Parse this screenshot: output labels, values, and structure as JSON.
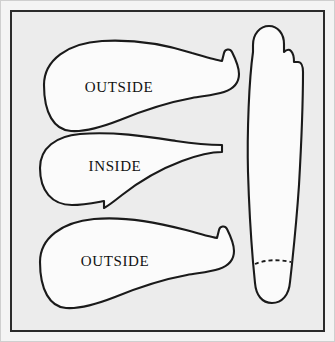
{
  "figure": {
    "background_color": "#ececec",
    "frame_color": "#2b2b2b",
    "piece_fill": "#fbfbfb",
    "piece_stroke": "#1a1a1a"
  },
  "pieces": [
    {
      "id": "upper-outside-top",
      "label": "OUTSIDE",
      "label_x": 109,
      "label_y": 79,
      "orientation": "horizontal",
      "position": "top-left"
    },
    {
      "id": "upper-inside-middle",
      "label": "INSIDE",
      "label_x": 105,
      "label_y": 158,
      "orientation": "horizontal",
      "position": "middle-left"
    },
    {
      "id": "upper-outside-bottom",
      "label": "OUTSIDE",
      "label_x": 105,
      "label_y": 253,
      "orientation": "horizontal",
      "position": "bottom-left"
    },
    {
      "id": "tongue-strip",
      "label": "",
      "orientation": "vertical",
      "position": "right",
      "has_fold_line": true,
      "fold_line_style": "dashed"
    }
  ],
  "annotations": {
    "dashed_line_name": "fold-line"
  }
}
